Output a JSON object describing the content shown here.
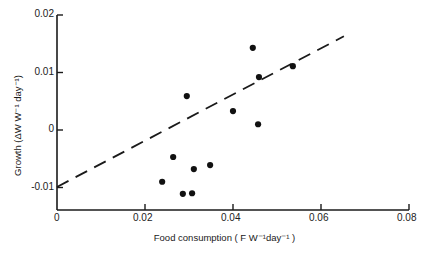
{
  "chart_data": {
    "type": "scatter",
    "title": "",
    "xlabel": "Food consumption ( F W⁻¹day⁻¹ )",
    "ylabel": "Growth (ΔW W⁻¹ day⁻¹)",
    "xlim": [
      0,
      0.08
    ],
    "ylim": [
      -0.0135,
      0.02
    ],
    "x_ticks": [
      "0",
      "0.02",
      "0.04",
      "0.06",
      "0.08"
    ],
    "y_ticks": [
      "0.02",
      "0.01",
      "0",
      "-0.01"
    ],
    "grid": false,
    "legend": null,
    "series": [
      {
        "name": "observations",
        "marker": "filled-circle",
        "points": [
          {
            "x": 0.0295,
            "y": 0.0059
          },
          {
            "x": 0.0445,
            "y": 0.0143
          },
          {
            "x": 0.0459,
            "y": 0.0092
          },
          {
            "x": 0.0536,
            "y": 0.0111
          },
          {
            "x": 0.04,
            "y": 0.0033
          },
          {
            "x": 0.0457,
            "y": 0.001
          },
          {
            "x": 0.0264,
            "y": -0.0047
          },
          {
            "x": 0.0348,
            "y": -0.0061
          },
          {
            "x": 0.0311,
            "y": -0.0068
          },
          {
            "x": 0.0239,
            "y": -0.009
          },
          {
            "x": 0.0286,
            "y": -0.0111
          },
          {
            "x": 0.0307,
            "y": -0.011
          }
        ]
      },
      {
        "name": "regression-line",
        "style": "dashed",
        "points": [
          {
            "x": 0.0,
            "y": -0.0099
          },
          {
            "x": 0.0652,
            "y": 0.0163
          }
        ]
      }
    ]
  },
  "axes": {
    "x_tick_labels": [
      "0",
      "0.02",
      "0.04",
      "0.06",
      "0.08"
    ],
    "y_tick_labels": [
      "0.02",
      "0.01",
      "0",
      "-0.01"
    ],
    "xlabel": "Food consumption ( F W⁻¹day⁻¹ )",
    "ylabel": "Growth (ΔW W⁻¹ day⁻¹)"
  },
  "colors": {
    "ink": "#1a1a1a",
    "background": "#ffffff"
  }
}
